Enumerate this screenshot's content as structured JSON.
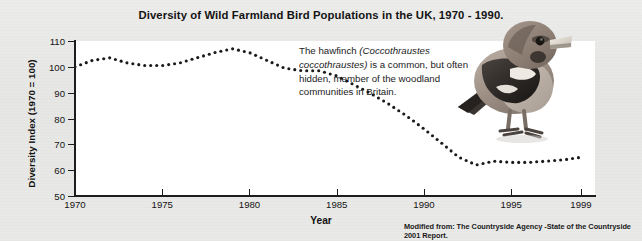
{
  "figure": {
    "title": "Diversity of Wild Farmland Bird Populations in the UK, 1970 - 1990.",
    "source_note": "Modified from: The Countryside Agency -State of the Countryside 2001 Report.",
    "background_color": "#e9e9e7",
    "plot_background_color": "#ffffff",
    "series_color": "#1a1a1a"
  },
  "annotation": {
    "text_before": "The hawfinch ",
    "scientific_name": "(Coccothraustes coccothraustes)",
    "text_after": " is a common, but often hidden, member of the woodland communities in Britain."
  },
  "bird_photo": {
    "alt": "hawfinch-photograph",
    "caption": ""
  },
  "chart_data": {
    "type": "line",
    "title": "Diversity of Wild Farmland Bird Populations in the UK, 1970 - 1990.",
    "xlabel": "Year",
    "ylabel": "Diversity Index (1970 = 100)",
    "xlim": [
      1970,
      1999.8
    ],
    "ylim": [
      50,
      110
    ],
    "xticks": [
      1970,
      1975,
      1980,
      1985,
      1990,
      1995,
      1999
    ],
    "xtick_labels": [
      "1970",
      "1975",
      "1980",
      "1985",
      "1990",
      "1995",
      "1999"
    ],
    "yticks": [
      50,
      60,
      70,
      80,
      90,
      100,
      110
    ],
    "ytick_labels": [
      "50",
      "60",
      "70",
      "80",
      "90",
      "100",
      "110"
    ],
    "grid": false,
    "legend": null,
    "line_style": "dotted",
    "marker": "dot",
    "x": [
      1970,
      1971,
      1972,
      1973,
      1974,
      1975,
      1976,
      1977,
      1978,
      1979,
      1980,
      1981,
      1982,
      1983,
      1984,
      1985,
      1986,
      1987,
      1988,
      1989,
      1990,
      1991,
      1992,
      1993,
      1994,
      1995,
      1996,
      1997,
      1998,
      1999
    ],
    "y": [
      100,
      102.5,
      103.5,
      101.5,
      100.5,
      100.5,
      101.5,
      103.5,
      105.5,
      107,
      105.5,
      102.5,
      99.5,
      98.5,
      98.5,
      96.5,
      93,
      89.5,
      85.5,
      81,
      76,
      70.5,
      65,
      62,
      63.5,
      63,
      63,
      63.5,
      64,
      65
    ],
    "series": [
      {
        "name": "Diversity Index",
        "values": [
          100,
          102.5,
          103.5,
          101.5,
          100.5,
          100.5,
          101.5,
          103.5,
          105.5,
          107,
          105.5,
          102.5,
          99.5,
          98.5,
          98.5,
          96.5,
          93,
          89.5,
          85.5,
          81,
          76,
          70.5,
          65,
          62,
          63.5,
          63,
          63,
          63.5,
          64,
          65
        ]
      }
    ]
  }
}
